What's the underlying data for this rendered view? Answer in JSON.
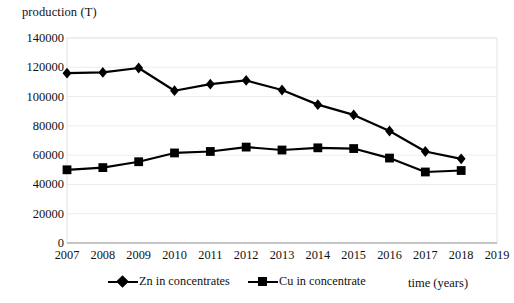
{
  "chart_data": {
    "type": "line",
    "title": "",
    "xlabel": "time (years)",
    "ylabel": "production (T)",
    "x": [
      2007,
      2008,
      2009,
      2010,
      2011,
      2012,
      2013,
      2014,
      2015,
      2016,
      2017,
      2018,
      2019
    ],
    "categories": [
      "2007",
      "2008",
      "2009",
      "2010",
      "2011",
      "2012",
      "2013",
      "2014",
      "2015",
      "2016",
      "2017",
      "2018",
      "2019"
    ],
    "xtick_labels": [
      "2007",
      "2008",
      "2009",
      "2010",
      "2011",
      "2012",
      "2013",
      "2014",
      "2015",
      "2016",
      "2017",
      "2018",
      "2019"
    ],
    "ytick_labels": [
      "140000",
      "120000",
      "100000",
      "80000",
      "60000",
      "40000",
      "20000",
      "0"
    ],
    "ytick_values": [
      140000,
      120000,
      100000,
      80000,
      60000,
      40000,
      20000,
      0
    ],
    "ylim": [
      0,
      140000
    ],
    "xlim": [
      2007,
      2019
    ],
    "grid": false,
    "legend_position": "bottom",
    "marker_color": "#000000",
    "line_color": "#000000",
    "series": [
      {
        "name": "Zn in concentrates",
        "marker": "diamond",
        "x": [
          2007,
          2008,
          2009,
          2010,
          2011,
          2012,
          2013,
          2014,
          2015,
          2016,
          2017,
          2018
        ],
        "values": [
          116000,
          116500,
          119500,
          104000,
          108500,
          111000,
          104500,
          94500,
          87500,
          76500,
          62500,
          57500
        ]
      },
      {
        "name": "Cu in concentrate",
        "marker": "square",
        "x": [
          2007,
          2008,
          2009,
          2010,
          2011,
          2012,
          2013,
          2014,
          2015,
          2016,
          2017,
          2018
        ],
        "values": [
          50000,
          51500,
          55500,
          61500,
          62500,
          65500,
          63500,
          65000,
          64500,
          58000,
          48500,
          49500
        ]
      }
    ]
  },
  "axes": {
    "y_title": "production (T)",
    "x_title": "time (years)"
  },
  "legend": {
    "items": [
      {
        "label": "Zn in concentrates",
        "marker": "diamond"
      },
      {
        "label": "Cu in concentrate",
        "marker": "square"
      }
    ]
  }
}
